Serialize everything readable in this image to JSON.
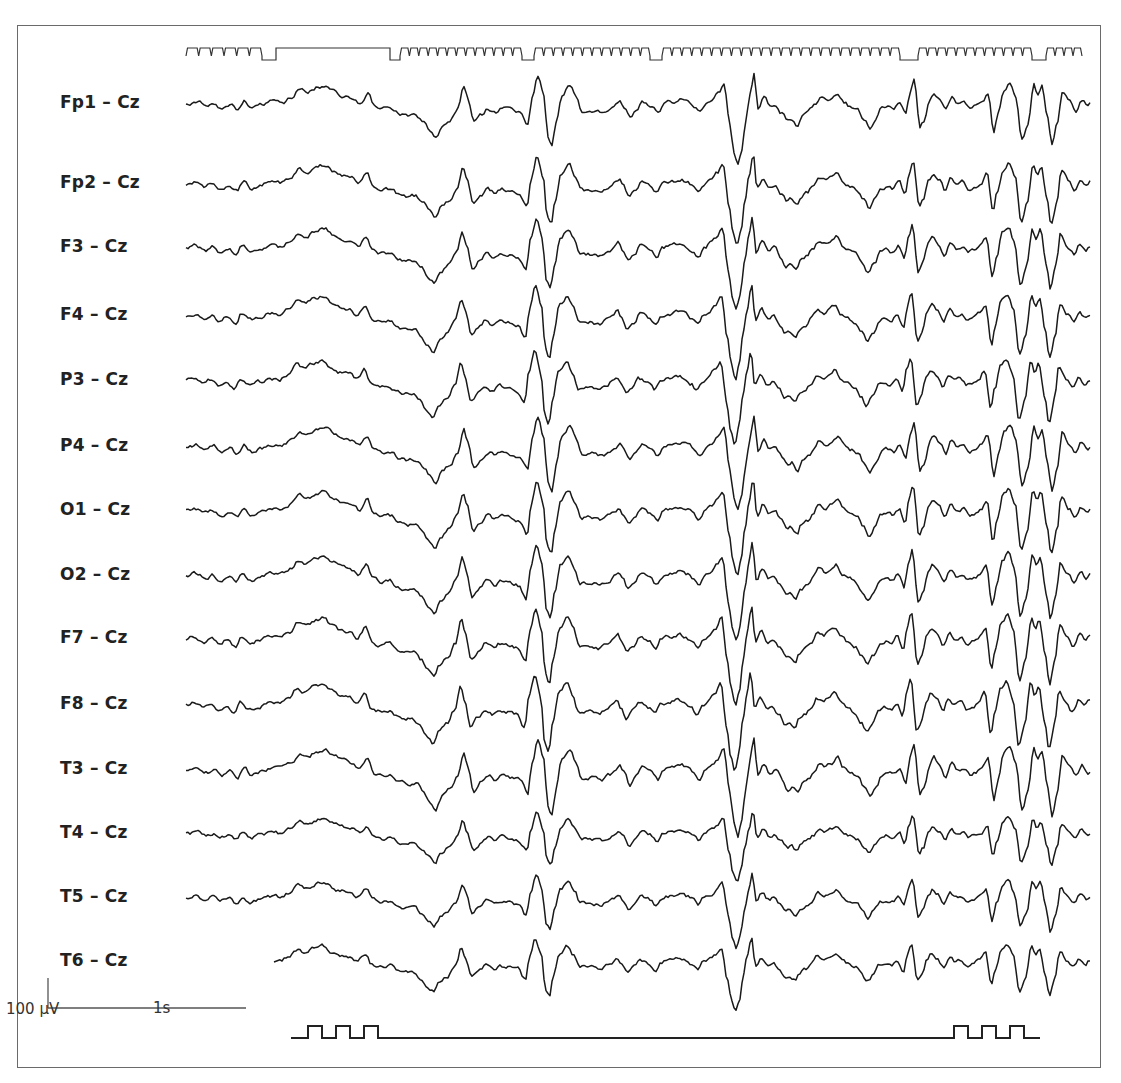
{
  "chart_data": {
    "type": "line",
    "title": "",
    "subtitle": "",
    "xlabel": "",
    "ylabel": "",
    "grid": false,
    "legend": null,
    "reference": "Cz",
    "channels": [
      {
        "label": "Fp1 – Cz",
        "y": 104
      },
      {
        "label": "Fp2 – Cz",
        "y": 184
      },
      {
        "label": "F3 – Cz",
        "y": 248
      },
      {
        "label": "F4 – Cz",
        "y": 316
      },
      {
        "label": "P3 – Cz",
        "y": 381
      },
      {
        "label": "P4 – Cz",
        "y": 447
      },
      {
        "label": "O1 – Cz",
        "y": 511
      },
      {
        "label": "O2 – Cz",
        "y": 576
      },
      {
        "label": "F7 – Cz",
        "y": 639
      },
      {
        "label": "F8 – Cz",
        "y": 705
      },
      {
        "label": "T3 – Cz",
        "y": 770
      },
      {
        "label": "T4 – Cz",
        "y": 834
      },
      {
        "label": "T5 – Cz",
        "y": 898
      },
      {
        "label": "T6 – Cz",
        "y": 962
      }
    ],
    "scale_bar": {
      "amplitude_label": "100 µV",
      "time_label": "1s",
      "amplitude_uV": 100,
      "time_s": 1
    },
    "marker_top": {
      "description": "photic stimulation/timing trace: pulse trains separated by pauses",
      "segments": [
        {
          "type": "pulses",
          "x_start": 186,
          "x_end": 262,
          "count": 6
        },
        {
          "type": "low",
          "x_start": 262,
          "x_end": 276
        },
        {
          "type": "high",
          "x_start": 276,
          "x_end": 390
        },
        {
          "type": "low",
          "x_start": 390,
          "x_end": 400
        },
        {
          "type": "pulses",
          "x_start": 400,
          "x_end": 522,
          "count": 13
        },
        {
          "type": "low",
          "x_start": 522,
          "x_end": 534
        },
        {
          "type": "pulses",
          "x_start": 534,
          "x_end": 650,
          "count": 12
        },
        {
          "type": "low",
          "x_start": 650,
          "x_end": 662
        },
        {
          "type": "pulses",
          "x_start": 662,
          "x_end": 900,
          "count": 24
        },
        {
          "type": "low",
          "x_start": 900,
          "x_end": 918
        },
        {
          "type": "pulses",
          "x_start": 918,
          "x_end": 1032,
          "count": 12
        },
        {
          "type": "low",
          "x_start": 1032,
          "x_end": 1046
        },
        {
          "type": "pulses",
          "x_start": 1046,
          "x_end": 1082,
          "count": 4
        }
      ]
    },
    "marker_bottom": {
      "description": "stimulus marker: three pulses at start and three pulses at end",
      "baseline_y": 1038,
      "x_start": 291,
      "x_end": 1040,
      "pulse_groups": [
        {
          "x_start": 308,
          "count": 3,
          "width": 14,
          "gap": 14
        },
        {
          "x_start": 954,
          "count": 3,
          "width": 14,
          "gap": 14
        }
      ]
    },
    "waveform_keypoints": {
      "description": "approximate shared waveform shape (x px, relative deflection px, negative = up) reconstructed from Fp1; all channels show similar generalized discharges",
      "points": [
        [
          186,
          0
        ],
        [
          195,
          -2
        ],
        [
          205,
          2
        ],
        [
          212,
          -1
        ],
        [
          220,
          4
        ],
        [
          228,
          0
        ],
        [
          236,
          6
        ],
        [
          242,
          -3
        ],
        [
          250,
          4
        ],
        [
          260,
          1
        ],
        [
          270,
          -2
        ],
        [
          280,
          -1
        ],
        [
          290,
          -6
        ],
        [
          298,
          -14
        ],
        [
          306,
          -11
        ],
        [
          316,
          -16
        ],
        [
          324,
          -18
        ],
        [
          332,
          -12
        ],
        [
          340,
          -8
        ],
        [
          350,
          -6
        ],
        [
          358,
          -1
        ],
        [
          366,
          -10
        ],
        [
          372,
          2
        ],
        [
          380,
          5
        ],
        [
          390,
          4
        ],
        [
          398,
          10
        ],
        [
          406,
          12
        ],
        [
          414,
          11
        ],
        [
          422,
          18
        ],
        [
          428,
          26
        ],
        [
          434,
          32
        ],
        [
          440,
          22
        ],
        [
          448,
          16
        ],
        [
          456,
          4
        ],
        [
          462,
          -16
        ],
        [
          466,
          -4
        ],
        [
          472,
          18
        ],
        [
          480,
          10
        ],
        [
          486,
          4
        ],
        [
          494,
          8
        ],
        [
          500,
          4
        ],
        [
          510,
          6
        ],
        [
          518,
          8
        ],
        [
          526,
          20
        ],
        [
          530,
          -6
        ],
        [
          536,
          -26
        ],
        [
          542,
          -8
        ],
        [
          546,
          30
        ],
        [
          550,
          38
        ],
        [
          554,
          16
        ],
        [
          560,
          -10
        ],
        [
          568,
          -18
        ],
        [
          574,
          -8
        ],
        [
          580,
          6
        ],
        [
          590,
          6
        ],
        [
          600,
          8
        ],
        [
          608,
          4
        ],
        [
          614,
          0
        ],
        [
          618,
          -4
        ],
        [
          622,
          2
        ],
        [
          628,
          12
        ],
        [
          634,
          6
        ],
        [
          640,
          -2
        ],
        [
          650,
          2
        ],
        [
          656,
          8
        ],
        [
          662,
          0
        ],
        [
          670,
          -2
        ],
        [
          680,
          -4
        ],
        [
          686,
          -2
        ],
        [
          692,
          2
        ],
        [
          698,
          8
        ],
        [
          704,
          0
        ],
        [
          710,
          -4
        ],
        [
          716,
          -10
        ],
        [
          722,
          -18
        ],
        [
          728,
          20
        ],
        [
          732,
          44
        ],
        [
          736,
          56
        ],
        [
          740,
          42
        ],
        [
          744,
          14
        ],
        [
          748,
          -8
        ],
        [
          752,
          -28
        ],
        [
          756,
          4
        ],
        [
          762,
          -6
        ],
        [
          768,
          2
        ],
        [
          774,
          0
        ],
        [
          780,
          8
        ],
        [
          786,
          16
        ],
        [
          790,
          14
        ],
        [
          796,
          20
        ],
        [
          800,
          12
        ],
        [
          806,
          8
        ],
        [
          812,
          2
        ],
        [
          818,
          -6
        ],
        [
          824,
          -3
        ],
        [
          830,
          -6
        ],
        [
          836,
          -10
        ],
        [
          842,
          -2
        ],
        [
          848,
          2
        ],
        [
          856,
          6
        ],
        [
          862,
          14
        ],
        [
          868,
          22
        ],
        [
          874,
          14
        ],
        [
          880,
          4
        ],
        [
          886,
          2
        ],
        [
          892,
          4
        ],
        [
          898,
          -2
        ],
        [
          904,
          10
        ],
        [
          908,
          -10
        ],
        [
          912,
          -22
        ],
        [
          918,
          22
        ],
        [
          922,
          16
        ],
        [
          928,
          -4
        ],
        [
          932,
          -10
        ],
        [
          938,
          -4
        ],
        [
          944,
          6
        ],
        [
          950,
          -6
        ],
        [
          956,
          0
        ],
        [
          962,
          -2
        ],
        [
          968,
          4
        ],
        [
          974,
          2
        ],
        [
          980,
          -2
        ],
        [
          986,
          -10
        ],
        [
          992,
          26
        ],
        [
          996,
          8
        ],
        [
          1002,
          -14
        ],
        [
          1008,
          -20
        ],
        [
          1014,
          -6
        ],
        [
          1020,
          34
        ],
        [
          1026,
          18
        ],
        [
          1032,
          -18
        ],
        [
          1036,
          -8
        ],
        [
          1040,
          -16
        ],
        [
          1046,
          14
        ],
        [
          1050,
          38
        ],
        [
          1056,
          16
        ],
        [
          1060,
          -12
        ],
        [
          1068,
          -2
        ],
        [
          1074,
          6
        ],
        [
          1080,
          -4
        ],
        [
          1086,
          2
        ],
        [
          1090,
          -2
        ]
      ]
    }
  },
  "colors": {
    "trace": "#1a1a1a",
    "frame": "#6a6a6a",
    "label": "#222222",
    "background": "#ffffff"
  }
}
